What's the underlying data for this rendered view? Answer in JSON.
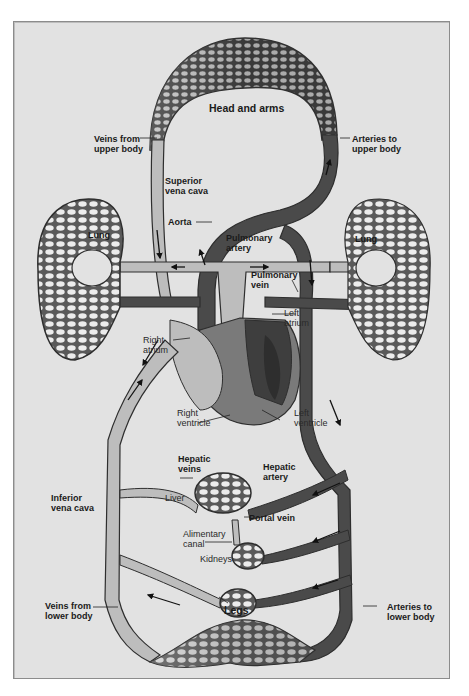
{
  "diagram": {
    "colors": {
      "background": "#e2e2e2",
      "frame_border": "#8c8c8c",
      "deoxygenated_vessel": "#bdbdbd",
      "oxygenated_vessel": "#4a4a4a",
      "vessel_outline": "#2e2e2e",
      "heart_mid": "#7a7a7a",
      "label_text": "#1a1a1a"
    },
    "labels": {
      "head_and_arms": "Head and arms",
      "veins_upper": "Veins from\nupper body",
      "arteries_upper": "Arteries to\nupper body",
      "superior_vena_cava": "Superior\nvena cava",
      "aorta": "Aorta",
      "lung_left": "Lung",
      "lung_right": "Lung",
      "pulmonary_artery": "Pulmonary\nartery",
      "pulmonary_vein": "Pulmonary\nvein",
      "left_atrium": "Left\natrium",
      "right_atrium": "Right\natrium",
      "right_ventricle": "Right\nventricle",
      "left_ventricle": "Left\nventricle",
      "hepatic_veins": "Hepatic\nveins",
      "hepatic_artery": "Hepatic\nartery",
      "liver": "Liver",
      "inferior_vena_cava": "Inferior\nvena cava",
      "portal_vein": "Portal vein",
      "alimentary_canal": "Alimentary\ncanal",
      "kidneys": "Kidneys",
      "legs": "Legs",
      "veins_lower": "Veins from\nlower body",
      "arteries_lower": "Arteries to\nlower body"
    }
  }
}
